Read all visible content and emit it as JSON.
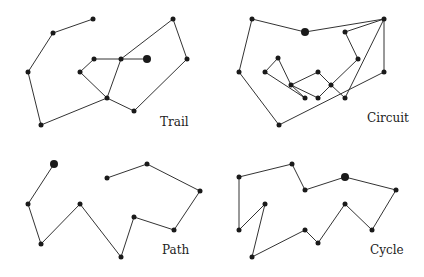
{
  "diagrams": [
    {
      "label": "Trail",
      "label_pos": [
        160,
        126
      ],
      "nodes": [
        [
          93,
          19
        ],
        [
          53,
          33
        ],
        [
          28,
          72
        ],
        [
          41,
          125
        ],
        [
          107,
          98
        ],
        [
          134,
          111
        ],
        [
          187,
          59
        ],
        [
          173,
          19
        ],
        [
          121,
          59
        ],
        [
          94,
          59
        ],
        [
          80,
          72
        ],
        [
          147,
          59
        ]
      ],
      "big": [
        11
      ],
      "edges": [
        [
          0,
          1
        ],
        [
          1,
          2
        ],
        [
          2,
          3
        ],
        [
          3,
          4
        ],
        [
          4,
          5
        ],
        [
          5,
          6
        ],
        [
          6,
          7
        ],
        [
          7,
          8
        ],
        [
          8,
          4
        ],
        [
          4,
          10
        ],
        [
          10,
          9
        ],
        [
          9,
          8
        ],
        [
          8,
          11
        ]
      ]
    },
    {
      "label": "Circuit",
      "label_pos": [
        367,
        122
      ],
      "nodes": [
        [
          252,
          19
        ],
        [
          305,
          32
        ],
        [
          384,
          19
        ],
        [
          345,
          32
        ],
        [
          358,
          59
        ],
        [
          384,
          72
        ],
        [
          345,
          98
        ],
        [
          279,
          125
        ],
        [
          239,
          72
        ],
        [
          278,
          58
        ],
        [
          265,
          72
        ],
        [
          291,
          85
        ],
        [
          305,
          98
        ],
        [
          318,
          72
        ],
        [
          331,
          85
        ],
        [
          318,
          98
        ]
      ],
      "big": [
        1
      ],
      "edges": [
        [
          0,
          1
        ],
        [
          1,
          2
        ],
        [
          2,
          3
        ],
        [
          3,
          4
        ],
        [
          4,
          14
        ],
        [
          14,
          13
        ],
        [
          13,
          11
        ],
        [
          11,
          9
        ],
        [
          9,
          10
        ],
        [
          10,
          12
        ],
        [
          12,
          11
        ],
        [
          11,
          15
        ],
        [
          15,
          14
        ],
        [
          14,
          6
        ],
        [
          6,
          2
        ],
        [
          2,
          5
        ],
        [
          5,
          7
        ],
        [
          7,
          8
        ],
        [
          8,
          0
        ]
      ]
    },
    {
      "label": "Path",
      "label_pos": [
        162,
        254
      ],
      "nodes": [
        [
          54,
          164
        ],
        [
          28,
          204
        ],
        [
          41,
          244
        ],
        [
          80,
          204
        ],
        [
          121,
          257
        ],
        [
          134,
          217
        ],
        [
          174,
          230
        ],
        [
          200,
          191
        ],
        [
          147,
          164
        ],
        [
          107,
          178
        ]
      ],
      "big": [
        0
      ],
      "edges": [
        [
          0,
          1
        ],
        [
          1,
          2
        ],
        [
          2,
          3
        ],
        [
          3,
          4
        ],
        [
          4,
          5
        ],
        [
          5,
          6
        ],
        [
          6,
          7
        ],
        [
          7,
          8
        ],
        [
          8,
          9
        ]
      ]
    },
    {
      "label": "Cycle",
      "label_pos": [
        370,
        254
      ],
      "nodes": [
        [
          239,
          177
        ],
        [
          292,
          164
        ],
        [
          305,
          190
        ],
        [
          345,
          177
        ],
        [
          396,
          190
        ],
        [
          372,
          230
        ],
        [
          345,
          204
        ],
        [
          318,
          243
        ],
        [
          305,
          230
        ],
        [
          252,
          257
        ],
        [
          265,
          204
        ],
        [
          239,
          230
        ]
      ],
      "big": [
        3
      ],
      "edges": [
        [
          0,
          1
        ],
        [
          1,
          2
        ],
        [
          2,
          3
        ],
        [
          3,
          4
        ],
        [
          4,
          5
        ],
        [
          5,
          6
        ],
        [
          6,
          7
        ],
        [
          7,
          8
        ],
        [
          8,
          9
        ],
        [
          9,
          10
        ],
        [
          10,
          11
        ],
        [
          11,
          0
        ]
      ]
    }
  ]
}
